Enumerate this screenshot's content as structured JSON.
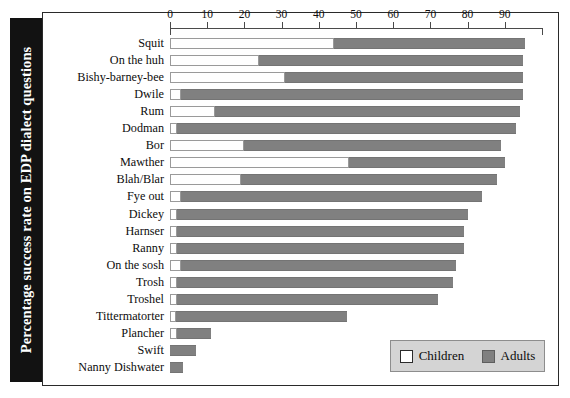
{
  "chart_data": {
    "type": "bar",
    "orientation": "horizontal",
    "stacked": true,
    "title": "",
    "ylabel": "Percentage success rate on EDP dialect questions",
    "xlabel": "",
    "xlim": [
      0,
      100
    ],
    "grid": false,
    "legend_position": "bottom-right",
    "axis_ticks": [
      0,
      10,
      20,
      30,
      40,
      50,
      60,
      70,
      80,
      90
    ],
    "categories": [
      "Squit",
      "On the huh",
      "Bishy-barney-bee",
      "Dwile",
      "Rum",
      "Dodman",
      "Bor",
      "Mawther",
      "Blah/Blar",
      "Fye out",
      "Dickey",
      "Harnser",
      "Ranny",
      "On the sosh",
      "Trosh",
      "Troshel",
      "Tittermatorter",
      "Plancher",
      "Swift",
      "Nanny Dishwater"
    ],
    "series": [
      {
        "name": "Children",
        "color": "#ffffff",
        "values": [
          44,
          24,
          31,
          3,
          12,
          2,
          20,
          48,
          19,
          3,
          2,
          2,
          2,
          3,
          2,
          2,
          1,
          2,
          0,
          0
        ]
      },
      {
        "name": "Adults",
        "color": "#808080",
        "values": [
          51.5,
          71,
          64,
          92,
          82,
          91,
          69,
          42,
          69,
          81,
          78,
          77,
          77,
          74,
          74,
          70,
          46,
          9,
          7,
          3.5
        ]
      }
    ],
    "totals": [
      95.5,
      95,
      95,
      95,
      94,
      93,
      89,
      90,
      88,
      84,
      80,
      79,
      79,
      77,
      76,
      72,
      47,
      11,
      7,
      3.5
    ]
  },
  "legend": {
    "items": [
      {
        "label": "Children",
        "swatch": "children"
      },
      {
        "label": "Adults",
        "swatch": "adults"
      }
    ]
  }
}
